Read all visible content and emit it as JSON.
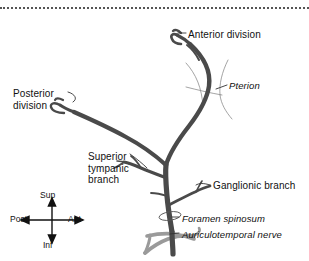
{
  "figure": {
    "background_color": "#ffffff",
    "artery_color": "#4a4a4a",
    "nerve_color": "#9a9a9a",
    "suture_color": "#999999",
    "leader_color": "#333333",
    "text_color": "#111111",
    "top_rule_style": "dotted"
  },
  "labels": {
    "anterior_division": "Anterior division",
    "pterion": "Pterion",
    "posterior_division": "Posterior\ndivision",
    "superior_tympanic_branch": "Superior\ntympanic\nbranch",
    "ganglionic_branch": "Ganglionic branch",
    "foramen_spinosum": "Foramen spinosum",
    "auriculotemporal_nerve": "Auriculotemporal nerve"
  },
  "compass": {
    "superior": "Sup",
    "inferior": "Inf",
    "posterior": "Post",
    "anterior": "Ant"
  }
}
